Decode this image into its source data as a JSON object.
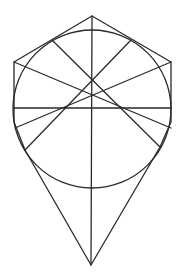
{
  "diagram": {
    "type": "geometric-construction",
    "stroke_color": "#2a2a2a",
    "background": "#ffffff",
    "circle": {
      "cx": 92,
      "cy": 109,
      "r": 79
    },
    "outline": [
      [
        92,
        16
      ],
      [
        14,
        62
      ],
      [
        14,
        122
      ],
      [
        25,
        150
      ],
      [
        91,
        265
      ],
      [
        160,
        147
      ],
      [
        171,
        122
      ],
      [
        171,
        62
      ],
      [
        92,
        16
      ]
    ],
    "lines": [
      {
        "name": "vertical-axis",
        "x1": 92,
        "y1": 16,
        "x2": 91,
        "y2": 265
      },
      {
        "name": "horizontal-diameter",
        "x1": 14,
        "y1": 108,
        "x2": 171,
        "y2": 108
      },
      {
        "name": "diag-upper-left-tangent-to-lower-right",
        "x1": 52,
        "y1": 40,
        "x2": 160,
        "y2": 147
      },
      {
        "name": "diag-upper-right-tangent-to-lower-left",
        "x1": 131,
        "y1": 40,
        "x2": 25,
        "y2": 150
      },
      {
        "name": "diag-left-vertex-to-right",
        "x1": 14,
        "y1": 62,
        "x2": 171,
        "y2": 128
      },
      {
        "name": "diag-right-vertex-to-left",
        "x1": 171,
        "y1": 62,
        "x2": 15,
        "y2": 128
      }
    ]
  }
}
